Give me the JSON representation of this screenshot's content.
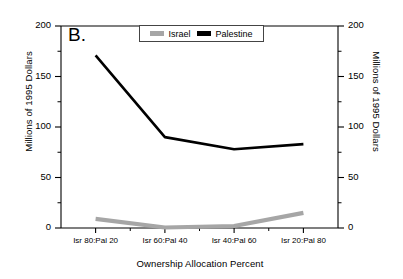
{
  "panel": {
    "label": "B."
  },
  "legend": {
    "position": "top-center-inside",
    "entries": [
      {
        "name": "Israel",
        "color": "#a6a6a6"
      },
      {
        "name": "Palestine",
        "color": "#000000"
      }
    ]
  },
  "axes": {
    "y_left": {
      "title": "Millions of 1995 Dollars",
      "ticks": [
        0,
        50,
        100,
        150,
        200
      ],
      "minor_ticks": [
        25,
        75,
        125,
        175
      ],
      "range": [
        0,
        200
      ]
    },
    "y_right": {
      "title": "Millions of 1995 Dollars",
      "ticks": [
        0,
        50,
        100,
        150,
        200
      ],
      "minor_ticks": [
        25,
        75,
        125,
        175
      ],
      "range": [
        0,
        200
      ]
    },
    "x": {
      "title": "Ownership Allocation Percent",
      "categories": [
        "Isr 80:Pal 20",
        "Isr 60:Pal 40",
        "Isr 40:Pal 60",
        "Isr 20:Pal 80"
      ]
    }
  },
  "chart_data": {
    "type": "line",
    "title": "B.",
    "xlabel": "Ownership Allocation Percent",
    "ylabel": "Millions of 1995 Dollars",
    "categories": [
      "Isr 80:Pal 20",
      "Isr 60:Pal 40",
      "Isr 40:Pal 60",
      "Isr 20:Pal 80"
    ],
    "ylim": [
      0,
      200
    ],
    "yticks": [
      0,
      50,
      100,
      150,
      200
    ],
    "grid": false,
    "legend_position": "upper center (inside axes)",
    "series": [
      {
        "name": "Israel",
        "color": "#a6a6a6",
        "values": [
          9,
          0.5,
          2,
          15
        ]
      },
      {
        "name": "Palestine",
        "color": "#000000",
        "values": [
          171,
          90,
          78,
          83
        ]
      }
    ]
  }
}
